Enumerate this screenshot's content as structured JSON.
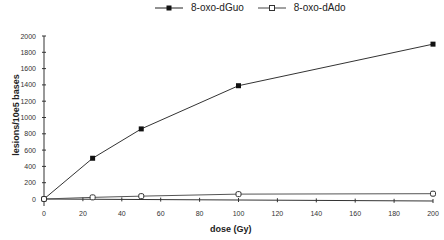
{
  "chart_data": {
    "type": "line",
    "title": "",
    "xlabel": "dose (Gy)",
    "ylabel": "lesions/10e5 bases",
    "xlim": [
      0,
      200
    ],
    "ylim": [
      0,
      2000
    ],
    "xticks": [
      0,
      20,
      40,
      60,
      80,
      100,
      120,
      140,
      160,
      180,
      200
    ],
    "yticks": [
      0,
      200,
      400,
      600,
      800,
      1000,
      1200,
      1400,
      1600,
      1800,
      2000
    ],
    "grid": false,
    "legend_position": "top",
    "series": [
      {
        "name": "8-oxo-dGuo",
        "marker": "filled-square",
        "x": [
          0,
          25,
          50,
          100,
          200
        ],
        "values": [
          0,
          500,
          860,
          1390,
          1900
        ]
      },
      {
        "name": "8-oxo-dAdo",
        "marker": "open-square",
        "x": [
          0,
          25,
          50,
          100,
          200
        ],
        "values": [
          0,
          20,
          35,
          60,
          65
        ]
      }
    ]
  },
  "legend": {
    "series1": "8-oxo-dGuo",
    "series2": "8-oxo-dAdo"
  },
  "axes": {
    "xlabel": "dose (Gy)",
    "ylabel": "lesions/10e5 bases"
  }
}
